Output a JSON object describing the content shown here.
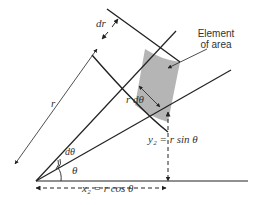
{
  "diagram": {
    "labels": {
      "dr": "dr",
      "r": "r",
      "r_dtheta": "r dθ",
      "dtheta": "dθ",
      "theta": "θ",
      "element_line1": "Element",
      "element_line2": "of area",
      "y2": "y₂ = r sin θ",
      "x2": "x₂ = r cos θ"
    },
    "colors": {
      "line": "#222222",
      "shade": "#b5b5b5",
      "text": "#333333"
    }
  }
}
